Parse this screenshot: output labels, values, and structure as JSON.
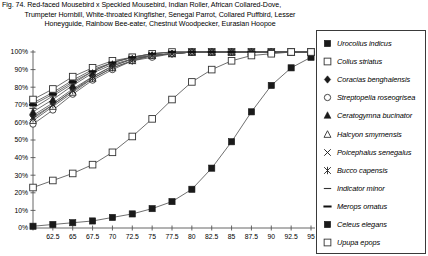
{
  "figure": {
    "number": "Fig. 74.",
    "caption_lines": [
      "Fig. 74.  Red-faced Mousebird x Speckled Mousebird, Indian Roller, African Collared-Dove,",
      "Trumpeter Hornbill, White-throated Kingfisher, Senegal Parrot, Collared Puffbird, Lesser",
      "Honeyguide, Rainbow Bee-eater, Chestnut Woodpecker, Eurasian Hoopoe"
    ]
  },
  "chart_data": {
    "type": "line",
    "title": "",
    "xlabel": "",
    "ylabel": "",
    "xlim": [
      60,
      95
    ],
    "ylim": [
      0,
      100
    ],
    "grid": false,
    "legend_position": "right",
    "x": [
      60,
      62.5,
      65,
      67.5,
      70,
      72.5,
      75,
      77.5,
      80,
      82.5,
      85,
      87.5,
      90,
      92.5,
      95
    ],
    "xticklabels": [
      "",
      "62.5",
      "65",
      "67.5",
      "70",
      "72.5",
      "75",
      "77.5",
      "80",
      "82.5",
      "85",
      "87.5",
      "90",
      "92.5",
      "95"
    ],
    "yticklabels": [
      "0%",
      "10%",
      "20%",
      "30%",
      "40%",
      "50%",
      "60%",
      "70%",
      "80%",
      "90%",
      "100%"
    ],
    "ytickvalues": [
      0,
      10,
      20,
      30,
      40,
      50,
      60,
      70,
      80,
      90,
      100
    ],
    "series": [
      {
        "name": "Urocolius indicus",
        "marker": "filled-square",
        "values": [
          71,
          77,
          84,
          90,
          94,
          97,
          98,
          99,
          100,
          100,
          100,
          100,
          100,
          100,
          100
        ]
      },
      {
        "name": "Colius striatus",
        "marker": "open-square",
        "values": [
          73,
          79,
          86,
          91,
          95,
          97,
          99,
          100,
          100,
          100,
          100,
          100,
          100,
          100,
          100
        ]
      },
      {
        "name": "Coracias benghalensis",
        "marker": "filled-diamond",
        "values": [
          64,
          71,
          79,
          86,
          92,
          96,
          98,
          99,
          100,
          100,
          100,
          100,
          100,
          100,
          100
        ]
      },
      {
        "name": "Streptopelia roseogrisea",
        "marker": "open-circle",
        "values": [
          59,
          67,
          76,
          84,
          90,
          95,
          97,
          99,
          100,
          100,
          100,
          100,
          100,
          100,
          100
        ]
      },
      {
        "name": "Ceratogymna bucinator",
        "marker": "filled-triangle",
        "values": [
          66,
          73,
          81,
          88,
          93,
          96,
          98,
          99,
          100,
          100,
          100,
          100,
          100,
          100,
          100
        ]
      },
      {
        "name": "Halcyon smyrnensis",
        "marker": "open-triangle",
        "values": [
          61,
          69,
          77,
          85,
          91,
          95,
          98,
          99,
          100,
          100,
          100,
          100,
          100,
          100,
          100
        ]
      },
      {
        "name": "Poicephalus senegalus",
        "marker": "x-cross",
        "values": [
          63,
          70,
          78,
          86,
          92,
          96,
          98,
          99,
          100,
          100,
          100,
          100,
          100,
          100,
          100
        ]
      },
      {
        "name": "Bucco capensis",
        "marker": "asterisk",
        "values": [
          62,
          70,
          78,
          85,
          91,
          95,
          98,
          99,
          100,
          100,
          100,
          100,
          100,
          100,
          100
        ]
      },
      {
        "name": "Indicator minor",
        "marker": "thin-dash",
        "values": [
          68,
          75,
          82,
          89,
          94,
          97,
          99,
          100,
          100,
          100,
          100,
          100,
          100,
          100,
          100
        ]
      },
      {
        "name": "Merops ornatus",
        "marker": "thick-dash",
        "values": [
          70,
          76,
          83,
          89,
          94,
          97,
          99,
          100,
          100,
          100,
          100,
          100,
          100,
          100,
          100
        ]
      },
      {
        "name": "Celeus elegans",
        "marker": "filled-square",
        "values": [
          1,
          2,
          3,
          4,
          6,
          8,
          11,
          15,
          22,
          34,
          49,
          66,
          81,
          91,
          97
        ]
      },
      {
        "name": "Upupa epops",
        "marker": "open-square",
        "values": [
          23,
          27,
          31,
          36,
          43,
          52,
          62,
          73,
          83,
          90,
          95,
          98,
          99,
          100,
          100
        ]
      }
    ]
  },
  "legend": {
    "items": [
      {
        "label": "Urocolius indicus",
        "marker": "filled-square"
      },
      {
        "label": "Colius striatus",
        "marker": "open-square"
      },
      {
        "label": "Coracias benghalensis",
        "marker": "filled-diamond"
      },
      {
        "label": "Streptopelia roseogrisea",
        "marker": "open-circle"
      },
      {
        "label": "Ceratogymna bucinator",
        "marker": "filled-triangle"
      },
      {
        "label": "Halcyon smyrnensis",
        "marker": "open-triangle"
      },
      {
        "label": "Poicephalus senegalus",
        "marker": "x-cross"
      },
      {
        "label": "Bucco capensis",
        "marker": "asterisk"
      },
      {
        "label": "Indicator minor",
        "marker": "thin-dash"
      },
      {
        "label": "Merops ornatus",
        "marker": "thick-dash"
      },
      {
        "label": "Celeus elegans",
        "marker": "filled-square"
      },
      {
        "label": "Upupa epops",
        "marker": "open-square"
      }
    ]
  },
  "colors": {
    "line": "#555555",
    "marker_fill": "#1a1a1a",
    "marker_open": "#ffffff",
    "axis": "#555555",
    "text": "#000000",
    "legend_border": "#3a3a3a"
  }
}
